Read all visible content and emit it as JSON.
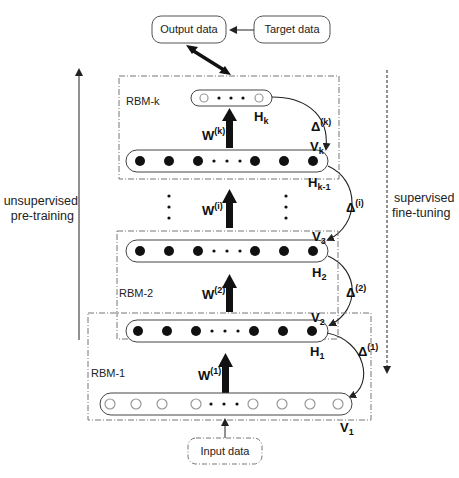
{
  "diagram": {
    "boxes": {
      "output": "Output data",
      "target": "Target data",
      "input": "Input data"
    },
    "rbm_labels": {
      "k": "RBM-k",
      "two": "RBM-2",
      "one": "RBM-1"
    },
    "layer_labels": {
      "Hk": "H",
      "Hk_sub": "k",
      "Vk": "V",
      "Vk_sub": "k",
      "Hk1": "H",
      "Hk1_sub": "k-1",
      "V3": "V",
      "V3_sub": "3",
      "H2": "H",
      "H2_sub": "2",
      "V2": "V",
      "V2_sub": "2",
      "H1": "H",
      "H1_sub": "1",
      "V1": "V",
      "V1_sub": "1"
    },
    "weights": {
      "k": {
        "base": "W",
        "sup": "(k)"
      },
      "i": {
        "base": "W",
        "sup": "(i)"
      },
      "two": {
        "base": "W",
        "sup": "(2)"
      },
      "one": {
        "base": "W",
        "sup": "(1)"
      }
    },
    "deltas": {
      "k": {
        "base": "Δ",
        "sup": "(k)"
      },
      "i": {
        "base": "Δ",
        "sup": "(i)"
      },
      "two": {
        "base": "Δ",
        "sup": "(2)"
      },
      "one": {
        "base": "Δ",
        "sup": "(1)"
      }
    },
    "side_labels": {
      "left_line1": "unsupervised",
      "left_line2": "pre-training",
      "right_line1": "supervised",
      "right_line2": "fine-tuning"
    },
    "colors": {
      "filled_unit": "#111111",
      "open_unit_stroke": "#999999",
      "dashed_border": "#777777"
    }
  }
}
